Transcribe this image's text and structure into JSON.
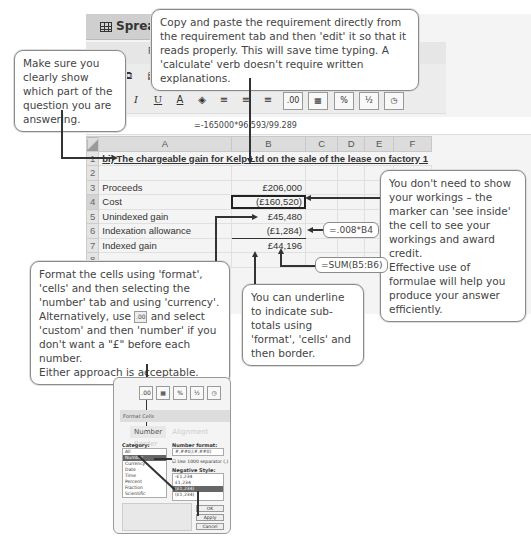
{
  "app": {
    "title": "Spreads",
    "menu_label": "Forma",
    "zoom_value": "100%",
    "toolbar_row1": [
      "cut-icon",
      "copy-icon",
      "paste-icon",
      "format-painter-icon",
      "undo-icon",
      "redo-icon"
    ],
    "toolbar_row2": {
      "bold": "B",
      "italic": "I",
      "underline": "U",
      "font_color": "A",
      "fill": "◈",
      "align": [
        "≡",
        "≡",
        "≡"
      ],
      "decimal": ".00",
      "number_format": "▦",
      "percent": "%",
      "fraction": "½",
      "time": "◷"
    }
  },
  "formula_bar": {
    "cell_ref": "B4",
    "formula": "=-165000*96.593/99.289"
  },
  "sheet": {
    "columns": [
      "A",
      "B",
      "C",
      "D",
      "E",
      "F"
    ],
    "rows": [
      {
        "num": "1",
        "a": "bi) The chargeable gain for Kelp Ltd on the sale of the lease on factory 1",
        "b": ""
      },
      {
        "num": "2",
        "a": "",
        "b": ""
      },
      {
        "num": "3",
        "a": "Proceeds",
        "b": "£206,000"
      },
      {
        "num": "4",
        "a": "Cost",
        "b": "(£160,520)"
      },
      {
        "num": "5",
        "a": "Unindexed gain",
        "b": "£45,480"
      },
      {
        "num": "6",
        "a": "Indexation allowance",
        "b": "(£1,284)"
      },
      {
        "num": "7",
        "a": "Indexed gain",
        "b": "£44,196"
      },
      {
        "num": "8",
        "a": "",
        "b": ""
      }
    ]
  },
  "formula_tags": {
    "b6": "=.008*B4",
    "b7": "=SUM(B5:B6)"
  },
  "callouts": {
    "top": "Copy and paste the requirement directly from the requirement tab and then 'edit' it so that it reads properly. This will save time typing. A 'calculate' verb doesn't require written explanations.",
    "left": "Make sure you clearly show which part of the question you are answering.",
    "right_p1": "You don't need to show your workings – the marker can 'see inside' the cell to see your workings and award credit.",
    "right_p2": "Effective use of formulae will help you produce your answer efficiently.",
    "format_p1": "Format the cells using 'format', 'cells' and then selecting the 'number' tab and using 'currency'.",
    "format_p2a": "Alternatively, use",
    "format_icon": ".00",
    "format_p2b": "and select 'custom' and then 'number' if you don't want a \"£\" before each number.",
    "format_p3": "Either approach is acceptable.",
    "underline": "You can underline to indicate sub-totals using 'format', 'cells' and then border."
  },
  "format_dialog": {
    "toolbar": [
      ".00",
      "▦",
      "%",
      "½",
      "◷"
    ],
    "title": "Format Cells",
    "tabs": [
      "Number",
      "Alignment",
      "Border"
    ],
    "category_label": "Category:",
    "categories": [
      "All",
      "Number",
      "Currency",
      "Date",
      "Time",
      "Percent",
      "Fraction",
      "Scientific",
      "Text"
    ],
    "selected_category": "Number",
    "number_format_label": "Number format:",
    "number_format_value": "#,##0;(#,##0)",
    "separator_checkbox": "Use 1000 separator (,)",
    "negative_style_label": "Negative Style:",
    "negative_styles": [
      "-£1,234",
      "£1,234",
      "(£1,234)",
      "(£1,234)"
    ],
    "selected_negative": 2,
    "buttons": [
      "OK",
      "Apply",
      "Cancel"
    ]
  }
}
